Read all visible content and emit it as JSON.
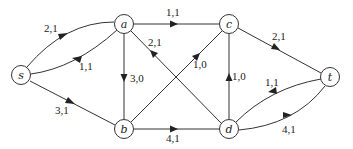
{
  "diagram": {
    "type": "flow-network",
    "nodes": [
      {
        "id": "s",
        "label": "s",
        "x": 21,
        "y": 75
      },
      {
        "id": "a",
        "label": "a",
        "x": 124,
        "y": 24
      },
      {
        "id": "b",
        "label": "b",
        "x": 124,
        "y": 129
      },
      {
        "id": "c",
        "label": "c",
        "x": 229,
        "y": 24
      },
      {
        "id": "d",
        "label": "d",
        "x": 229,
        "y": 129
      },
      {
        "id": "t",
        "label": "t",
        "x": 330,
        "y": 77
      }
    ],
    "edges": [
      {
        "from": "s",
        "to": "a",
        "label": "2,1"
      },
      {
        "from": "a",
        "to": "s",
        "label": "1,1"
      },
      {
        "from": "s",
        "to": "b",
        "label": "3,1"
      },
      {
        "from": "a",
        "to": "c",
        "label": "1,1"
      },
      {
        "from": "a",
        "to": "b",
        "label": "3,0"
      },
      {
        "from": "d",
        "to": "a",
        "label": "2,1"
      },
      {
        "from": "b",
        "to": "c",
        "label": "1,0"
      },
      {
        "from": "b",
        "to": "d",
        "label": "4,1"
      },
      {
        "from": "d",
        "to": "c",
        "label": "1,0"
      },
      {
        "from": "c",
        "to": "t",
        "label": "2,1"
      },
      {
        "from": "t",
        "to": "d",
        "label": "1,1"
      },
      {
        "from": "d",
        "to": "t",
        "label": "4,1"
      }
    ]
  }
}
